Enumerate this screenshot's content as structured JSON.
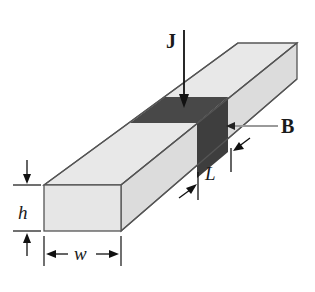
{
  "diagram": {
    "type": "isometric rectangular bar (conductor) with current density and magnetic field",
    "labels": {
      "current_density": "J",
      "magnetic_field": "B",
      "length": "L",
      "height": "h",
      "width": "w"
    },
    "colors": {
      "bar_fill": "#e6e6e6",
      "bar_side_fill": "#dedede",
      "dark_band": "#4a4a4a",
      "edge": "#555555",
      "b_pointer": "#9a9a9a",
      "text": "#1a1a1a"
    }
  }
}
